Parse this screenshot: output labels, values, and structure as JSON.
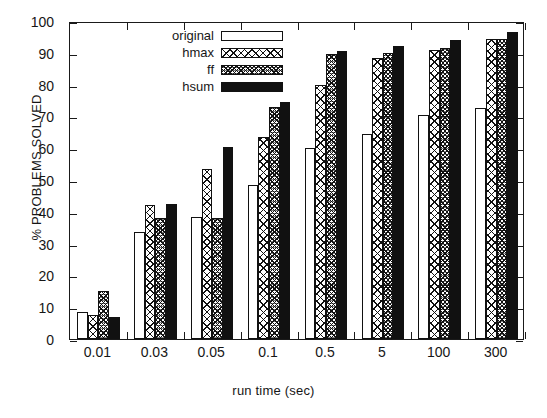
{
  "chart_data": {
    "type": "bar",
    "title": "",
    "xlabel": "run time (sec)",
    "ylabel": "% PROBLEMS SOLVED",
    "categories": [
      "0.01",
      "0.03",
      "0.05",
      "0.1",
      "0.5",
      "5",
      "100",
      "300"
    ],
    "series": [
      {
        "name": "original",
        "fill": "white",
        "values": [
          8.5,
          33.5,
          38.5,
          48.5,
          60.0,
          64.5,
          70.5,
          72.5
        ]
      },
      {
        "name": "hmax",
        "fill": "crosshatch",
        "values": [
          7.5,
          42.0,
          53.5,
          63.5,
          80.0,
          88.5,
          91.0,
          94.5
        ]
      },
      {
        "name": "ff",
        "fill": "dense-dots",
        "values": [
          15.0,
          38.0,
          38.0,
          73.0,
          89.5,
          90.0,
          91.5,
          94.5
        ]
      },
      {
        "name": "hsum",
        "fill": "solid-black",
        "values": [
          7.0,
          42.5,
          60.5,
          74.5,
          90.5,
          92.0,
          94.0,
          96.5
        ]
      }
    ],
    "ylim": [
      0,
      100
    ],
    "yticks": [
      0,
      10,
      20,
      30,
      40,
      50,
      60,
      70,
      80,
      90,
      100
    ],
    "ytick_labels": [
      "0",
      "10",
      "20",
      "30",
      "40",
      "50",
      "60",
      "70",
      "80",
      "90",
      "100"
    ],
    "grid": false,
    "legend_position": "top-left-inside",
    "legend_entries": [
      "original",
      "hmax",
      "ff",
      "hsum"
    ],
    "colors": {
      "axis": "#1a1a1a",
      "text": "#161616",
      "background": "#ffffff",
      "hsum_fill": "#111111"
    }
  }
}
